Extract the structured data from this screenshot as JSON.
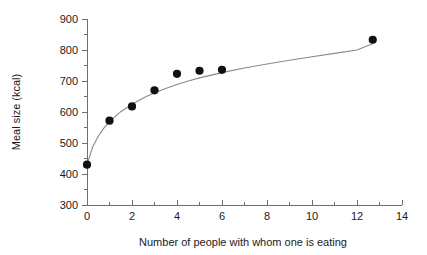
{
  "chart_data": {
    "type": "scatter",
    "title": "",
    "subtitle": "",
    "xlabel": "Number of people with whom one is eating",
    "ylabel": "Meal size (kcal)",
    "xlim": [
      0,
      14
    ],
    "ylim": [
      300,
      900
    ],
    "x_major_ticks": [
      0,
      2,
      4,
      6,
      8,
      10,
      12,
      14
    ],
    "x_minor_ticks": [
      1,
      3,
      5,
      7,
      9,
      11,
      13
    ],
    "y_major_ticks": [
      300,
      400,
      500,
      600,
      700,
      800,
      900
    ],
    "y_minor_ticks": [
      350,
      450,
      550,
      650,
      750,
      850
    ],
    "x_tick_labels": [
      "0",
      "2",
      "4",
      "6",
      "8",
      "10",
      "12",
      "14"
    ],
    "y_tick_labels": [
      "300",
      "400",
      "500",
      "600",
      "700",
      "800",
      "900"
    ],
    "grid": false,
    "legend": false,
    "legend_position": "none",
    "series": [
      {
        "name": "Observed mean meal size",
        "marker": "filled-circle",
        "marker_color": "#111111",
        "points": [
          {
            "x": 0,
            "y": 430
          },
          {
            "x": 1,
            "y": 572
          },
          {
            "x": 2,
            "y": 618
          },
          {
            "x": 3,
            "y": 670
          },
          {
            "x": 4,
            "y": 723
          },
          {
            "x": 5,
            "y": 733
          },
          {
            "x": 6,
            "y": 736
          },
          {
            "x": 12.7,
            "y": 833
          }
        ]
      },
      {
        "name": "Logarithmic fit",
        "marker": "none",
        "line_color": "#8a8a8a",
        "fit_type": "logarithmic",
        "points": [
          {
            "x": 0.0,
            "y": 430
          },
          {
            "x": 0.25,
            "y": 487
          },
          {
            "x": 0.5,
            "y": 522
          },
          {
            "x": 0.75,
            "y": 548
          },
          {
            "x": 1.0,
            "y": 569
          },
          {
            "x": 1.5,
            "y": 601
          },
          {
            "x": 2.0,
            "y": 625
          },
          {
            "x": 2.5,
            "y": 645
          },
          {
            "x": 3.0,
            "y": 662
          },
          {
            "x": 3.5,
            "y": 676
          },
          {
            "x": 4.0,
            "y": 689
          },
          {
            "x": 4.5,
            "y": 700
          },
          {
            "x": 5.0,
            "y": 710
          },
          {
            "x": 6.0,
            "y": 727
          },
          {
            "x": 7.0,
            "y": 742
          },
          {
            "x": 8.0,
            "y": 755
          },
          {
            "x": 9.0,
            "y": 767
          },
          {
            "x": 10.0,
            "y": 778
          },
          {
            "x": 11.0,
            "y": 789
          },
          {
            "x": 12.0,
            "y": 800
          },
          {
            "x": 12.7,
            "y": 820
          }
        ]
      }
    ],
    "colors": {
      "marker": "#111111",
      "curve": "#8a8a8a",
      "axis": "#6e6e6e",
      "text": "#1a1a1a",
      "background": "#ffffff"
    }
  }
}
